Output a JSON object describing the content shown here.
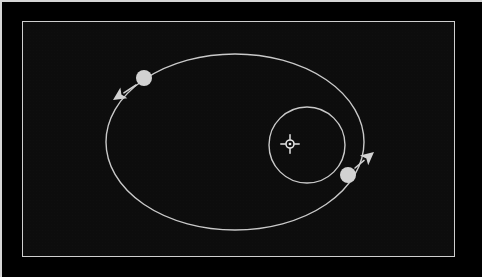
{
  "app": {
    "view_title": "Orbital Plot",
    "background_color": "#000000",
    "panel_background_color": "#0d0d0d",
    "frame_color": "#cfcfcf",
    "orbit_line_color": "#c9c9c9",
    "body_color": "#d2d2d2",
    "marker_color": "#e2e2e2"
  },
  "panel": {
    "x": 22,
    "y": 21,
    "width": 433,
    "height": 236
  },
  "chart_data": {
    "type": "scatter",
    "subtitle": "",
    "xlabel": "",
    "ylabel": "",
    "grid": false,
    "legend_position": "none",
    "annotations": [],
    "center_marker": {
      "name": "central-body",
      "label": "",
      "symbol": "crosshair-star",
      "x": 290,
      "y": 144,
      "radius": 4
    },
    "orbits": [
      {
        "name": "outer-orbit",
        "shape": "ellipse",
        "center_x": 235,
        "center_y": 142,
        "radius_x": 129,
        "radius_y": 88,
        "stroke_width": 1.4,
        "color": "#c9c9c9"
      },
      {
        "name": "inner-orbit",
        "shape": "circle",
        "center_x": 307,
        "center_y": 145,
        "radius_x": 38,
        "radius_y": 38,
        "stroke_width": 1.4,
        "color": "#c9c9c9"
      }
    ],
    "bodies": [
      {
        "name": "outer-body",
        "label": "",
        "x": 144,
        "y": 78,
        "radius": 8,
        "color": "#d2d2d2",
        "velocity_arrow": {
          "tail_x": 136,
          "tail_y": 85,
          "tip_x": 113,
          "tip_y": 100,
          "direction": "down-left"
        }
      },
      {
        "name": "inner-body",
        "label": "",
        "x": 348,
        "y": 175,
        "radius": 8,
        "color": "#d2d2d2",
        "velocity_arrow": {
          "tail_x": 355,
          "tail_y": 168,
          "tip_x": 374,
          "tip_y": 152,
          "direction": "up-right"
        }
      }
    ]
  }
}
